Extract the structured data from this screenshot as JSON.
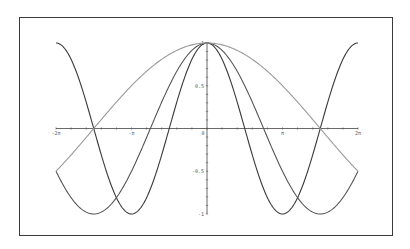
{
  "chart_data": {
    "type": "line",
    "title": "",
    "xlabel": "",
    "ylabel": "",
    "xlim": [
      -6.2832,
      6.2832
    ],
    "ylim": [
      -1,
      1
    ],
    "grid": false,
    "legend": null,
    "x_ticks": [
      {
        "value": -6.2832,
        "label": "-2π"
      },
      {
        "value": -3.1416,
        "label": "-π"
      },
      {
        "value": 0,
        "label": "0"
      },
      {
        "value": 3.1416,
        "label": "π"
      },
      {
        "value": 6.2832,
        "label": "2π"
      }
    ],
    "y_ticks": [
      {
        "value": 1,
        "label": "1"
      },
      {
        "value": 0.5,
        "label": "0.5"
      },
      {
        "value": -0.5,
        "label": "-0.5"
      },
      {
        "value": -1,
        "label": "-1"
      }
    ],
    "series": [
      {
        "name": "cos(x)",
        "color": "#3a3a3a",
        "freq": 1.0
      },
      {
        "name": "cos(2x/3)",
        "color": "#555555",
        "freq": 0.6667
      },
      {
        "name": "cos(x/3)",
        "color": "#9a9a9a",
        "freq": 0.3333
      }
    ]
  }
}
